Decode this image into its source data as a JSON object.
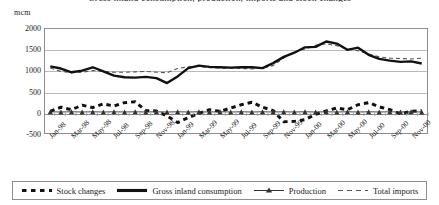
{
  "chart_data": {
    "type": "line",
    "title": "Gross inland consumption, production, imports and stock changes",
    "ylabel": "mcm",
    "xlabel": "",
    "ylim": [
      -500,
      2000
    ],
    "yticks": [
      2000,
      1500,
      1000,
      500,
      0,
      -500
    ],
    "grid": true,
    "legend_position": "bottom",
    "x": [
      "Jan-98",
      "Feb-98",
      "Mar-98",
      "Apr-98",
      "May-98",
      "Jun-98",
      "Jul-98",
      "Aug-98",
      "Sep-98",
      "Oct-98",
      "Nov-98",
      "Dec-98",
      "Jan-99",
      "Feb-99",
      "Mar-99",
      "Apr-99",
      "May-99",
      "Jun-99",
      "Jul-99",
      "Aug-99",
      "Sep-99",
      "Oct-99",
      "Nov-99",
      "Dec-99",
      "Jan-00",
      "Feb-00",
      "Mar-00",
      "Apr-00",
      "May-00",
      "Jun-00",
      "Jul-00",
      "Aug-00",
      "Sep-00",
      "Oct-00",
      "Nov-00",
      "Dec-00"
    ],
    "xtick_labels": [
      "Jan-98",
      "Mar-98",
      "May-98",
      "Jul-98",
      "Sep-98",
      "Nov-98",
      "Jan-99",
      "Mar-99",
      "May-99",
      "Jul-99",
      "Sep-99",
      "Nov-99",
      "Jan-00",
      "Mar-00",
      "May-00",
      "Jul-00",
      "Sep-00",
      "Nov-00"
    ],
    "series": [
      {
        "name": "Stock changes",
        "style": "thick-dashed",
        "color": "#111111",
        "values": [
          20,
          120,
          60,
          170,
          110,
          200,
          150,
          230,
          250,
          40,
          30,
          -90,
          -250,
          -130,
          -30,
          60,
          20,
          100,
          180,
          240,
          120,
          40,
          -230,
          -220,
          -180,
          -50,
          30,
          100,
          60,
          180,
          230,
          130,
          60,
          -40,
          20,
          40
        ]
      },
      {
        "name": "Gross inland consumption",
        "style": "thick-solid",
        "color": "#111111",
        "values": [
          1100,
          1050,
          960,
          1000,
          1080,
          980,
          880,
          840,
          830,
          850,
          820,
          700,
          860,
          1060,
          1120,
          1090,
          1080,
          1070,
          1080,
          1080,
          1060,
          1180,
          1330,
          1430,
          1560,
          1570,
          1700,
          1650,
          1500,
          1550,
          1380,
          1280,
          1240,
          1210,
          1220,
          1170
        ],
        "annotations": [
          {
            "label": "peak",
            "x": "Mar-00",
            "y": 1700
          },
          {
            "label": "trough",
            "x": "Dec-98",
            "y": 700
          }
        ]
      },
      {
        "name": "Production",
        "style": "marker-line",
        "marker": "triangle",
        "color": "#333333",
        "values": [
          10,
          5,
          10,
          5,
          10,
          5,
          10,
          5,
          10,
          5,
          10,
          5,
          10,
          5,
          10,
          5,
          10,
          5,
          10,
          5,
          10,
          5,
          10,
          5,
          10,
          5,
          10,
          5,
          10,
          5,
          10,
          5,
          10,
          5,
          10,
          5
        ]
      },
      {
        "name": "Total imports",
        "style": "thin-dashed",
        "color": "#555555",
        "values": [
          1060,
          980,
          950,
          960,
          1000,
          980,
          960,
          960,
          970,
          980,
          960,
          950,
          1050,
          1090,
          1100,
          1070,
          1060,
          1060,
          1050,
          1040,
          1060,
          1120,
          1300,
          1450,
          1520,
          1610,
          1640,
          1600,
          1520,
          1480,
          1400,
          1330,
          1300,
          1290,
          1280,
          1300
        ]
      }
    ]
  },
  "legend": {
    "items": [
      {
        "label": "Stock changes"
      },
      {
        "label": "Gross inland consumption"
      },
      {
        "label": "Production"
      },
      {
        "label": "Total imports"
      }
    ]
  }
}
